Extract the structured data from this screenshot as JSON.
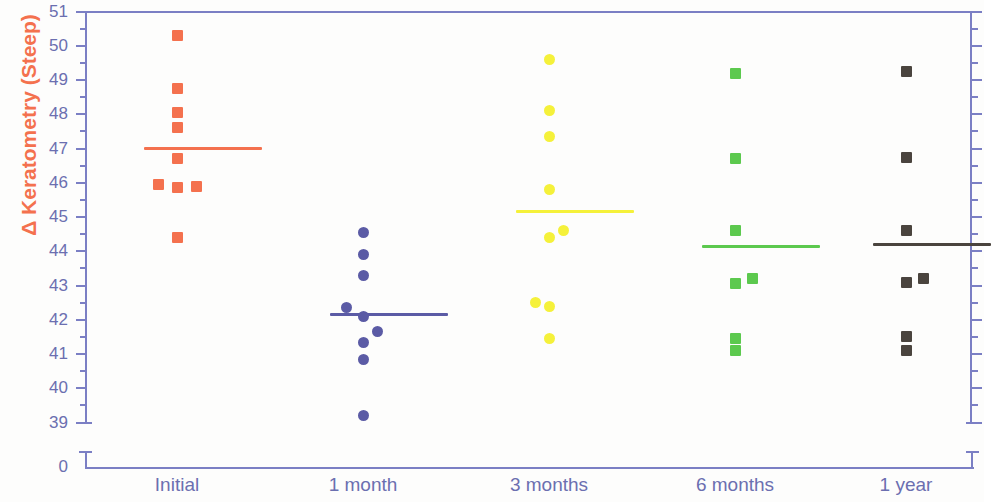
{
  "chart_data": {
    "type": "scatter",
    "title": "",
    "xlabel": "",
    "ylabel": "Δ Keratometry (Steep)",
    "ylim": [
      39,
      51
    ],
    "y_axis_break_to_zero": true,
    "y_ticks": [
      51,
      50,
      49,
      48,
      47,
      46,
      45,
      44,
      43,
      42,
      41,
      40,
      39,
      0
    ],
    "y_minor_ticks_per_interval": 1,
    "grid": false,
    "legend": "none",
    "categories": [
      "Initial",
      "1 month",
      "3 months",
      "6 months",
      "1 year"
    ],
    "groups": [
      {
        "name": "Initial",
        "color": "#f4714e",
        "marker": "square",
        "mean": 47.0,
        "mean_line_width": 118,
        "values": [
          50.3,
          48.75,
          48.05,
          47.6,
          46.7,
          45.95,
          45.85,
          45.9,
          44.4
        ],
        "jitter": [
          0,
          0,
          0,
          0,
          0,
          -19,
          0,
          19,
          0
        ]
      },
      {
        "name": "1 month",
        "color": "#5b5ba5",
        "marker": "circle",
        "mean": 42.15,
        "mean_line_width": 118,
        "values": [
          44.55,
          43.9,
          43.3,
          42.35,
          42.1,
          41.65,
          41.35,
          40.85,
          39.2
        ],
        "jitter": [
          0,
          0,
          0,
          -17,
          0,
          14,
          0,
          0,
          0
        ]
      },
      {
        "name": "3 months",
        "color": "#f5f13a",
        "marker": "circle",
        "mean": 45.15,
        "mean_line_width": 118,
        "values": [
          49.6,
          48.1,
          47.35,
          45.8,
          44.6,
          44.4,
          42.5,
          42.4,
          41.45
        ],
        "jitter": [
          0,
          0,
          0,
          0,
          14,
          0,
          -14,
          0,
          0
        ]
      },
      {
        "name": "6 months",
        "color": "#5cc94e",
        "marker": "square",
        "mean": 44.15,
        "mean_line_width": 118,
        "values": [
          49.2,
          46.7,
          44.6,
          43.05,
          43.2,
          41.45,
          41.1
        ],
        "jitter": [
          0,
          0,
          0,
          0,
          17,
          0,
          0
        ]
      },
      {
        "name": "1 year",
        "color": "#4a443e",
        "marker": "square",
        "mean": 44.2,
        "mean_line_width": 118,
        "values": [
          49.25,
          46.75,
          44.6,
          43.1,
          43.2,
          41.5,
          41.1
        ],
        "jitter": [
          0,
          0,
          0,
          0,
          17,
          0,
          0
        ]
      }
    ],
    "axis_color": "#7b7fc4",
    "tick_label_color": "#6b6fb0",
    "ylabel_color": "#f4714e"
  }
}
